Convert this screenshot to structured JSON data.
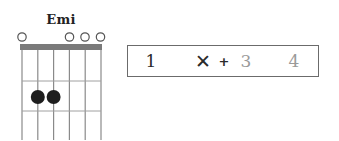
{
  "chord": {
    "name": "Emi",
    "strings": 6,
    "frets_shown": 3,
    "string_markers": [
      "open",
      "none",
      "none",
      "open",
      "open",
      "open"
    ],
    "fingered_dots": [
      {
        "string": 2,
        "fret": 2
      },
      {
        "string": 3,
        "fret": 2
      }
    ],
    "colors": {
      "nut": "#7a7a7a",
      "grid": "#8a8a8a",
      "dot": "#1e1e1e",
      "open_circle": "#555555"
    }
  },
  "rhythm": {
    "beats": [
      {
        "label": "1",
        "state": "active"
      },
      {
        "label": "✕",
        "state": "active"
      },
      {
        "label": "+",
        "state": "active"
      },
      {
        "label": "3",
        "state": "muted"
      },
      {
        "label": "4",
        "state": "muted"
      }
    ],
    "colors": {
      "active": "#2a2a2a",
      "muted": "#9a9a9a",
      "border": "#6b6b6b"
    }
  }
}
